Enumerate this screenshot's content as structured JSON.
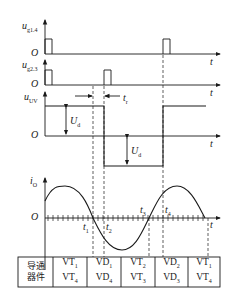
{
  "labels": {
    "ug14": "u",
    "ug14_sub": "g1.4",
    "ug23": "u",
    "ug23_sub": "g2.3",
    "uuv": "u",
    "uuv_sub": "UV",
    "io": "i",
    "io_sub": "O",
    "origin": "O",
    "t": "t",
    "tr": "t",
    "tr_sub": "r",
    "Ud1": "U",
    "Ud1_sub": "d",
    "Ud2": "U",
    "Ud2_sub": "d",
    "t1": "t",
    "t1_sub": "1",
    "t2": "t",
    "t2_sub": "2",
    "t3": "t",
    "t3_sub": "3",
    "t4": "t",
    "t4_sub": "4"
  },
  "table": {
    "header_line1": "导通",
    "header_line2": "器件",
    "cells": [
      {
        "a": "VT",
        "a_sub": "1",
        "b": "VT",
        "b_sub": "4"
      },
      {
        "a": "VD",
        "a_sub": "1",
        "b": "VD",
        "b_sub": "4"
      },
      {
        "a": "VT",
        "a_sub": "2",
        "b": "VT",
        "b_sub": "3"
      },
      {
        "a": "VD",
        "a_sub": "2",
        "b": "VD",
        "b_sub": "3"
      },
      {
        "a": "VT",
        "a_sub": "1",
        "b": "VT",
        "b_sub": "4"
      }
    ]
  }
}
